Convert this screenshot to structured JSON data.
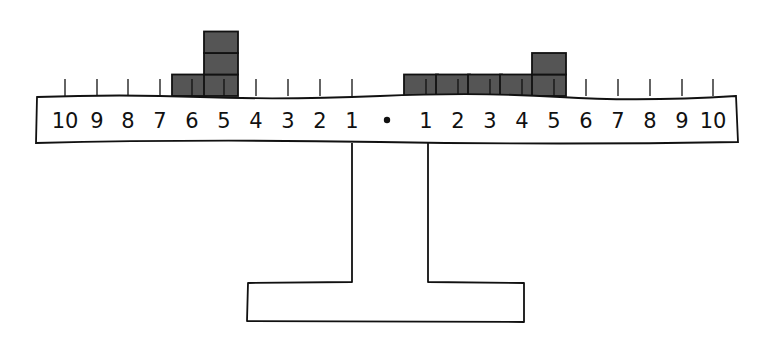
{
  "diagram": {
    "type": "balance-beam",
    "colors": {
      "stroke": "#111111",
      "block_fill": "#555555",
      "background": "#ffffff"
    },
    "center_marker": "•",
    "left_labels": [
      "10",
      "9",
      "8",
      "7",
      "6",
      "5",
      "4",
      "3",
      "2",
      "1"
    ],
    "right_labels": [
      "1",
      "2",
      "3",
      "4",
      "5",
      "6",
      "7",
      "8",
      "9",
      "10"
    ],
    "left_side_blocks": [
      {
        "position": 6,
        "count": 1
      },
      {
        "position": 5,
        "count": 3
      }
    ],
    "right_side_blocks": [
      {
        "position": 1,
        "count": 1
      },
      {
        "position": 2,
        "count": 1
      },
      {
        "position": 3,
        "count": 1
      },
      {
        "position": 4,
        "count": 1
      },
      {
        "position": 5,
        "count": 2
      }
    ]
  }
}
